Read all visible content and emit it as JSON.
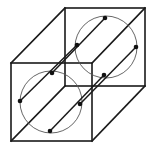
{
  "diagram": {
    "title": "",
    "colors": {
      "edges": "#1a1a1a",
      "circles": "#555555",
      "dots": "#111111",
      "background": "#ffffff"
    },
    "front_face": {
      "x1": 11,
      "y1": 63,
      "x2": 92,
      "y2": 141
    },
    "back_face": {
      "x1": 65,
      "y1": 8,
      "x2": 145,
      "y2": 86
    },
    "front_circle": {
      "cx": 51,
      "cy": 102,
      "r": 31
    },
    "back_circle": {
      "cx": 106,
      "cy": 47,
      "r": 31
    },
    "front_points": [
      {
        "name": "top",
        "x": 52,
        "y": 73
      },
      {
        "name": "left",
        "x": 20,
        "y": 101
      },
      {
        "name": "right",
        "x": 80,
        "y": 104
      },
      {
        "name": "bottom",
        "x": 50,
        "y": 131
      }
    ],
    "back_points": [
      {
        "name": "top",
        "x": 105,
        "y": 18
      },
      {
        "name": "left",
        "x": 77,
        "y": 45
      },
      {
        "name": "right",
        "x": 136,
        "y": 47
      },
      {
        "name": "bottom",
        "x": 104,
        "y": 75
      }
    ],
    "labels": []
  }
}
